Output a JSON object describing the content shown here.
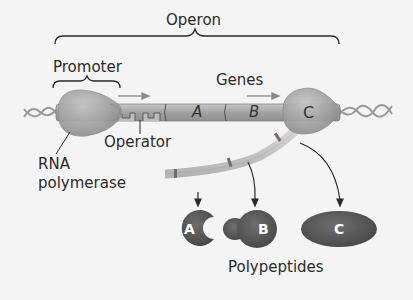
{
  "diagram": {
    "type": "operon-transcription-translation",
    "labels": {
      "operon": "Operon",
      "promoter": "Promoter",
      "genes": "Genes",
      "operator": "Operator",
      "rna_polymerase_line1": "RNA",
      "rna_polymerase_line2": "polymerase",
      "polypeptides": "Polypeptides"
    },
    "genes": [
      {
        "id": "A",
        "label": "A"
      },
      {
        "id": "B",
        "label": "B"
      },
      {
        "id": "C",
        "label": "C"
      }
    ],
    "polypeptides": [
      {
        "id": "A",
        "label": "A",
        "shape": "pac-man"
      },
      {
        "id": "B",
        "label": "B",
        "shape": "peanut"
      },
      {
        "id": "C",
        "label": "C",
        "shape": "ellipse"
      }
    ],
    "colors": {
      "background": "#f4f4f4",
      "dna_bar": "#a8a8a8",
      "polymerase": "#a4a4a4",
      "mrna": "#c8c8c8",
      "polypeptide": "#5a5a5a",
      "arrow": "#2a2a2a"
    }
  }
}
